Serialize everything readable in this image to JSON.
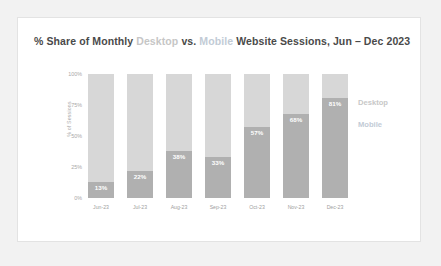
{
  "card": {
    "title_parts": {
      "pre": "% Share of Monthly ",
      "desktop": "Desktop",
      "mid": " vs. ",
      "mobile": "Mobile",
      "post": " Website Sessions, Jun – Dec 2023"
    },
    "title_full": "% Share of Monthly Desktop vs. Mobile Website Sessions, Jun – Dec 2023"
  },
  "legend": {
    "desktop": "Desktop",
    "mobile": "Mobile"
  },
  "colors": {
    "desktop": "#d7d7d7",
    "mobile": "#b0b0b0",
    "title_text": "#4a4a4a",
    "axis_text": "#a8a8a8",
    "card_background": "#ffffff",
    "page_background": "#f2f2f2",
    "value_label": "#ffffff"
  },
  "chart_data": {
    "type": "bar",
    "subtype": "stacked-100-percent",
    "title": "% Share of Monthly Desktop vs. Mobile Website Sessions, Jun – Dec 2023",
    "xlabel": "",
    "ylabel": "% of Sessions",
    "ylim": [
      0,
      100
    ],
    "yticks": [
      "0%",
      "25%",
      "50%",
      "75%",
      "100%"
    ],
    "ytick_values": [
      0,
      25,
      50,
      75,
      100
    ],
    "grid": false,
    "legend_position": "right",
    "categories": [
      "Jun-23",
      "Jul-23",
      "Aug-23",
      "Sep-23",
      "Oct-23",
      "Nov-23",
      "Dec-23"
    ],
    "series": [
      {
        "name": "Mobile",
        "color": "#b0b0b0",
        "values": [
          13,
          22,
          38,
          33,
          57,
          68,
          81
        ],
        "labels": [
          "13%",
          "22%",
          "38%",
          "33%",
          "57%",
          "68%",
          "81%"
        ]
      },
      {
        "name": "Desktop",
        "color": "#d7d7d7",
        "values": [
          87,
          78,
          62,
          67,
          43,
          32,
          19
        ],
        "labels": [
          "",
          "",
          "",
          "",
          "",
          "",
          ""
        ]
      }
    ]
  }
}
